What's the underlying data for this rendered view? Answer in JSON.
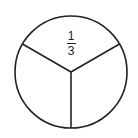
{
  "diagram": {
    "type": "fraction-circle",
    "parts": 3,
    "label": {
      "numerator": "1",
      "denominator": "3"
    },
    "stroke_color": "#222222",
    "fill_color": "#ffffff"
  }
}
